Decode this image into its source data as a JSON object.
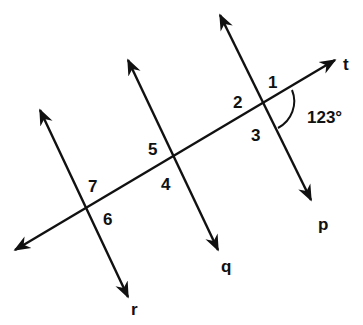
{
  "diagram": {
    "type": "parallel lines cut by transversal",
    "lines": [
      {
        "name": "t",
        "label": "t",
        "role": "transversal"
      },
      {
        "name": "p",
        "label": "p",
        "role": "parallel"
      },
      {
        "name": "q",
        "label": "q",
        "role": "parallel"
      },
      {
        "name": "r",
        "label": "r",
        "role": "parallel"
      }
    ],
    "angles": [
      {
        "id": "1",
        "label": "1"
      },
      {
        "id": "2",
        "label": "2"
      },
      {
        "id": "3",
        "label": "3"
      },
      {
        "id": "4",
        "label": "4"
      },
      {
        "id": "5",
        "label": "5"
      },
      {
        "id": "6",
        "label": "6"
      },
      {
        "id": "7",
        "label": "7"
      }
    ],
    "given_angle": {
      "label": "123°",
      "value": 123,
      "unit": "degrees"
    },
    "colors": {
      "stroke": "#111111",
      "background": "#ffffff"
    }
  }
}
